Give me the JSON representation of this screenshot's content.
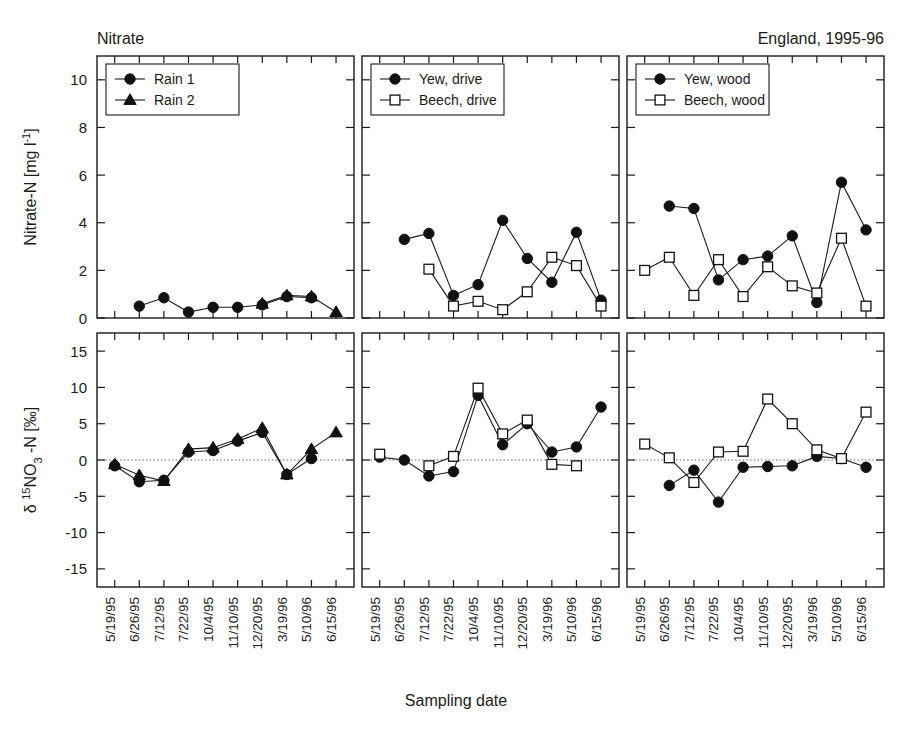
{
  "figure": {
    "top_left_label": "Nitrate",
    "top_right_label": "England, 1995-96",
    "x_axis_title": "Sampling date",
    "y_axis_title_top": "Nitrate-N [mg l-1]",
    "y_axis_title_bottom": "d 15NO3 -N [o/oo]"
  },
  "chart_data": [
    {
      "type": "line",
      "panel": "top-left",
      "title": "Nitrate",
      "xlabel": "Sampling date",
      "ylabel": "Nitrate-N [mg l-1]",
      "ylim": [
        0,
        11
      ],
      "yticks": [
        0,
        2,
        4,
        6,
        8,
        10
      ],
      "grid": false,
      "legend_position": "top-left",
      "categories": [
        "5/19/95",
        "6/26/95",
        "7/12/95",
        "7/22/95",
        "10/4/95",
        "11/10/95",
        "12/20/95",
        "3/19/96",
        "5/10/96",
        "6/15/96"
      ],
      "series": [
        {
          "name": "Rain 1",
          "marker": "filled-circle",
          "values": [
            null,
            0.5,
            0.85,
            0.25,
            0.45,
            0.45,
            0.55,
            0.9,
            0.85,
            null
          ]
        },
        {
          "name": "Rain 2",
          "marker": "filled-triangle",
          "values": [
            null,
            null,
            null,
            null,
            null,
            null,
            0.6,
            0.95,
            0.9,
            0.25
          ]
        }
      ]
    },
    {
      "type": "line",
      "panel": "top-middle",
      "xlabel": "Sampling date",
      "ylabel": "Nitrate-N [mg l-1]",
      "ylim": [
        0,
        11
      ],
      "yticks": [
        0,
        2,
        4,
        6,
        8,
        10
      ],
      "grid": false,
      "legend_position": "top-left",
      "categories": [
        "5/19/95",
        "6/26/95",
        "7/12/95",
        "7/22/95",
        "10/4/95",
        "11/10/95",
        "12/20/95",
        "3/19/96",
        "5/10/96",
        "6/15/96"
      ],
      "series": [
        {
          "name": "Yew, drive",
          "marker": "filled-circle",
          "values": [
            null,
            3.3,
            3.55,
            0.95,
            1.4,
            4.1,
            2.5,
            1.5,
            3.6,
            0.75
          ]
        },
        {
          "name": "Beech, drive",
          "marker": "open-square",
          "values": [
            null,
            null,
            2.05,
            0.5,
            0.7,
            0.35,
            1.1,
            2.55,
            2.2,
            0.5
          ]
        }
      ]
    },
    {
      "type": "line",
      "panel": "top-right",
      "xlabel": "Sampling date",
      "ylabel": "Nitrate-N [mg l-1]",
      "ylim": [
        0,
        11
      ],
      "yticks": [
        0,
        2,
        4,
        6,
        8,
        10
      ],
      "grid": false,
      "legend_position": "top-left",
      "categories": [
        "5/19/95",
        "6/26/95",
        "7/12/95",
        "7/22/95",
        "10/4/95",
        "11/10/95",
        "12/20/95",
        "3/19/96",
        "5/10/96",
        "6/15/96"
      ],
      "series": [
        {
          "name": "Yew, wood",
          "marker": "filled-circle",
          "values": [
            null,
            4.7,
            4.6,
            1.6,
            2.45,
            2.6,
            3.45,
            0.65,
            5.7,
            3.7
          ]
        },
        {
          "name": "Beech, wood",
          "marker": "open-square",
          "values": [
            2.0,
            2.55,
            0.95,
            2.45,
            0.9,
            2.15,
            1.35,
            1.05,
            3.35,
            0.5
          ]
        }
      ]
    },
    {
      "type": "line",
      "panel": "bottom-left",
      "xlabel": "Sampling date",
      "ylabel": "d 15NO3 -N [o/oo]",
      "ylim": [
        -17.5,
        17.5
      ],
      "yticks": [
        -15,
        -10,
        -5,
        0,
        5,
        10,
        15
      ],
      "grid": false,
      "zero_reference_line": 0,
      "categories": [
        "5/19/95",
        "6/26/95",
        "7/12/95",
        "7/22/95",
        "10/4/95",
        "11/10/95",
        "12/20/95",
        "3/19/96",
        "5/10/96",
        "6/15/96"
      ],
      "series": [
        {
          "name": "Rain 1",
          "marker": "filled-circle",
          "values": [
            -0.8,
            -3.0,
            -2.8,
            1.1,
            1.3,
            2.6,
            3.8,
            -2.0,
            0.2,
            null
          ]
        },
        {
          "name": "Rain 2",
          "marker": "filled-triangle",
          "values": [
            -0.6,
            -2.1,
            -2.9,
            1.5,
            1.7,
            2.9,
            4.4,
            -2.0,
            1.5,
            3.8
          ]
        }
      ]
    },
    {
      "type": "line",
      "panel": "bottom-middle",
      "xlabel": "Sampling date",
      "ylabel": "d 15NO3 -N [o/oo]",
      "ylim": [
        -17.5,
        17.5
      ],
      "yticks": [
        -15,
        -10,
        -5,
        0,
        5,
        10,
        15
      ],
      "grid": false,
      "zero_reference_line": 0,
      "categories": [
        "5/19/95",
        "6/26/95",
        "7/12/95",
        "7/22/95",
        "10/4/95",
        "11/10/95",
        "12/20/95",
        "3/19/96",
        "5/10/96",
        "6/15/96"
      ],
      "series": [
        {
          "name": "Yew, drive",
          "marker": "filled-circle",
          "values": [
            0.4,
            0.0,
            -2.2,
            -1.6,
            8.9,
            2.1,
            5.0,
            1.1,
            1.8,
            7.3
          ]
        },
        {
          "name": "Beech, drive",
          "marker": "open-square",
          "values": [
            0.8,
            null,
            -0.8,
            0.5,
            9.9,
            3.6,
            5.5,
            -0.6,
            -0.8,
            null
          ]
        }
      ]
    },
    {
      "type": "line",
      "panel": "bottom-right",
      "xlabel": "Sampling date",
      "ylabel": "d 15NO3 -N [o/oo]",
      "ylim": [
        -17.5,
        17.5
      ],
      "yticks": [
        -15,
        -10,
        -5,
        0,
        5,
        10,
        15
      ],
      "grid": false,
      "zero_reference_line": 0,
      "categories": [
        "5/19/95",
        "6/26/95",
        "7/12/95",
        "7/22/95",
        "10/4/95",
        "11/10/95",
        "12/20/95",
        "3/19/96",
        "5/10/96",
        "6/15/96"
      ],
      "series": [
        {
          "name": "Yew, wood",
          "marker": "filled-circle",
          "values": [
            null,
            -3.5,
            -1.4,
            -5.8,
            -1.0,
            -0.9,
            -0.8,
            0.5,
            0.2,
            -1.0
          ]
        },
        {
          "name": "Beech, wood",
          "marker": "open-square",
          "values": [
            2.2,
            0.3,
            -3.1,
            1.1,
            1.2,
            8.4,
            5.0,
            1.4,
            0.2,
            6.6
          ]
        }
      ]
    }
  ],
  "legends": {
    "top_left": [
      {
        "label": "Rain 1",
        "marker": "filled-circle"
      },
      {
        "label": "Rain 2",
        "marker": "filled-triangle"
      }
    ],
    "top_middle": [
      {
        "label": "Yew, drive",
        "marker": "filled-circle"
      },
      {
        "label": "Beech, drive",
        "marker": "open-square"
      }
    ],
    "top_right": [
      {
        "label": "Yew, wood",
        "marker": "filled-circle"
      },
      {
        "label": "Beech, wood",
        "marker": "open-square"
      }
    ]
  },
  "axes": {
    "y_top_ticks": [
      "0",
      "2",
      "4",
      "6",
      "8",
      "10"
    ],
    "y_bottom_ticks": [
      "-15",
      "-10",
      "-5",
      "0",
      "5",
      "10",
      "15"
    ],
    "x_ticks": [
      "5/19/95",
      "6/26/95",
      "7/12/95",
      "7/22/95",
      "10/4/95",
      "11/10/95",
      "12/20/95",
      "3/19/96",
      "5/10/96",
      "6/15/96"
    ]
  },
  "colors": {
    "ink": "#1a1a1a",
    "marker_fill": "#111111",
    "marker_open": "#ffffff",
    "background": "#ffffff"
  }
}
